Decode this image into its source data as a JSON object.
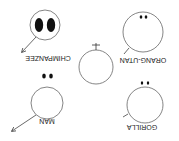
{
  "diagram": {
    "orientation": "rotated 180 degrees",
    "center": {
      "name": "egg",
      "symbol": "♀"
    },
    "sperm": [
      {
        "id": "chimpanzee",
        "label": "CHIMPANZEE",
        "nucleus": "large-pair"
      },
      {
        "id": "orang-utan",
        "label": "ORANG-UTAN",
        "nucleus": "small-pair"
      },
      {
        "id": "man",
        "label": "MAN",
        "nucleus": "small-pair"
      },
      {
        "id": "gorilla",
        "label": "GORILLA",
        "nucleus": "small-pair"
      }
    ]
  }
}
